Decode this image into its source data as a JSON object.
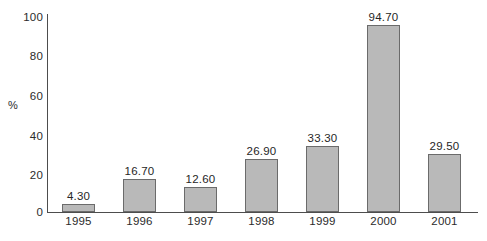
{
  "chart_data": {
    "type": "bar",
    "title": "",
    "subtitle": "",
    "xlabel": "",
    "ylabel": "%",
    "categories": [
      "1995",
      "1996",
      "1997",
      "1998",
      "1999",
      "2000",
      "2001"
    ],
    "values": [
      4.3,
      16.7,
      12.6,
      26.9,
      33.3,
      94.7,
      29.5
    ],
    "value_labels": [
      "4.30",
      "16.70",
      "12.60",
      "26.90",
      "33.30",
      "94.70",
      "29.50"
    ],
    "ylim": [
      0,
      100
    ],
    "ytick_values": [
      100,
      80,
      60,
      40,
      20,
      0
    ],
    "ytick_labels": [
      "100",
      "80",
      "60",
      "40",
      "20",
      "0"
    ],
    "grid": false,
    "legend": false,
    "legend_position": "none",
    "bar_fill_color": "#b9b9b9",
    "bar_border_color": "#6b6b6b",
    "axis_color": "#4d4d4d",
    "text_color": "#2b2b2b",
    "background_color": "#ffffff"
  }
}
